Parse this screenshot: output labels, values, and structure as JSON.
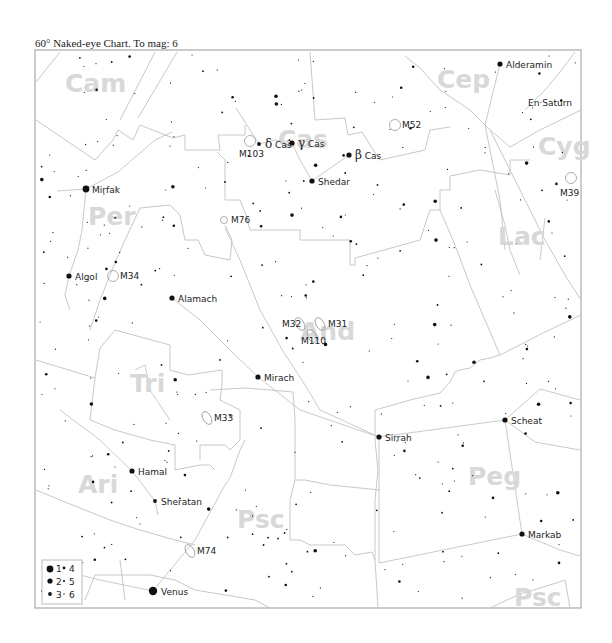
{
  "title": "60° Naked-eye Chart. To mag: 6",
  "frame": {
    "x": 35,
    "y": 50,
    "w": 546,
    "h": 558
  },
  "constellations": [
    {
      "abbr": "Cam",
      "x": 65,
      "y": 92
    },
    {
      "abbr": "Cas",
      "x": 278,
      "y": 148
    },
    {
      "abbr": "Cep",
      "x": 437,
      "y": 88
    },
    {
      "abbr": "Cyg",
      "x": 538,
      "y": 155
    },
    {
      "abbr": "Per",
      "x": 88,
      "y": 225
    },
    {
      "abbr": "Lac",
      "x": 498,
      "y": 245
    },
    {
      "abbr": "Tri",
      "x": 130,
      "y": 392
    },
    {
      "abbr": "Ari",
      "x": 78,
      "y": 493
    },
    {
      "abbr": "Peg",
      "x": 468,
      "y": 485
    },
    {
      "abbr": "Psc",
      "x": 237,
      "y": 528
    },
    {
      "abbr": "Psc",
      "x": 514,
      "y": 606
    },
    {
      "abbr": "And",
      "x": 300,
      "y": 340
    }
  ],
  "named_stars": [
    {
      "name": "Alderamin",
      "x": 500,
      "y": 64,
      "mag": 2
    },
    {
      "name": "Mirfak",
      "x": 86,
      "y": 189,
      "mag": 1
    },
    {
      "name": "Algol",
      "x": 69,
      "y": 276,
      "mag": 2
    },
    {
      "name": "Alamach",
      "x": 172,
      "y": 298,
      "mag": 2
    },
    {
      "name": "Shedar",
      "x": 312,
      "y": 181,
      "mag": 2
    },
    {
      "name": "β Cas",
      "x": 349,
      "y": 155,
      "mag": 2
    },
    {
      "name": "δ Cas",
      "x": 259,
      "y": 144,
      "mag": 3
    },
    {
      "name": "γ Cas",
      "x": 292,
      "y": 143,
      "mag": 2
    },
    {
      "name": "Mirach",
      "x": 258,
      "y": 377,
      "mag": 2
    },
    {
      "name": "Sirrah",
      "x": 379,
      "y": 437,
      "mag": 2
    },
    {
      "name": "Scheat",
      "x": 505,
      "y": 420,
      "mag": 2
    },
    {
      "name": "Markab",
      "x": 522,
      "y": 534,
      "mag": 2
    },
    {
      "name": "Hamal",
      "x": 132,
      "y": 471,
      "mag": 2
    },
    {
      "name": "Sheratan",
      "x": 155,
      "y": 501,
      "mag": 3
    }
  ],
  "planets": [
    {
      "name": "Venus",
      "x": 153,
      "y": 591
    },
    {
      "name": "En·Saturn",
      "x": 528,
      "y": 102
    }
  ],
  "deep_sky": [
    {
      "name": "M52",
      "x": 395,
      "y": 125,
      "type": "cluster"
    },
    {
      "name": "M103",
      "x": 250,
      "y": 141,
      "type": "cluster"
    },
    {
      "name": "M76",
      "x": 224,
      "y": 220,
      "type": "nebula"
    },
    {
      "name": "M34",
      "x": 113,
      "y": 276,
      "type": "cluster"
    },
    {
      "name": "M39",
      "x": 571,
      "y": 178,
      "type": "cluster"
    },
    {
      "name": "M31",
      "x": 320,
      "y": 324,
      "type": "galaxy"
    },
    {
      "name": "M32",
      "x": 300,
      "y": 324,
      "type": "galaxy"
    },
    {
      "name": "M110",
      "x": 312,
      "y": 336,
      "type": "galaxy"
    },
    {
      "name": "M33",
      "x": 207,
      "y": 418,
      "type": "galaxy"
    },
    {
      "name": "M74",
      "x": 190,
      "y": 551,
      "type": "galaxy"
    }
  ],
  "legend": {
    "rows": [
      {
        "left": "1",
        "right": "4"
      },
      {
        "left": "2",
        "right": "5"
      },
      {
        "left": "3",
        "right": "6"
      }
    ]
  }
}
